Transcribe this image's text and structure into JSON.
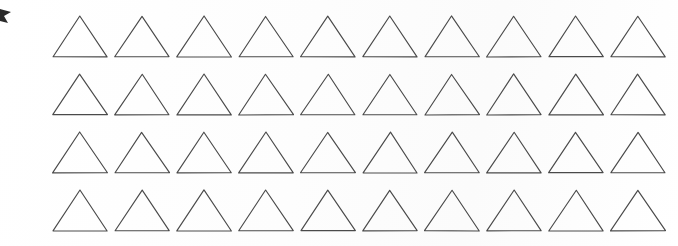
{
  "page": {
    "width": 678,
    "height": 246,
    "background_color": "#fefefe"
  },
  "corner_mark": {
    "name": "clipped-wedge-mark",
    "description": "Small dark wedge-shaped mark clipped at the left edge near the top",
    "color": "#2b2b2b",
    "x": 0,
    "y": 9,
    "width": 13,
    "height": 15
  },
  "grid": {
    "label": "Triangle grid",
    "columns": 10,
    "rows": 4,
    "total_shapes": 40,
    "origin_x": 52,
    "origin_y": 15,
    "column_pitch": 62,
    "row_pitch": 58,
    "shape": {
      "kind": "triangle",
      "name": "equilateral-triangle-outline",
      "fill": "none",
      "stroke_color": "#4a4a4a",
      "stroke_width": 1.15,
      "width": 56,
      "height": 43
    },
    "rows_data": [
      {
        "row_index": 1,
        "baseline_y": 58,
        "count": 10
      },
      {
        "row_index": 2,
        "baseline_y": 113,
        "count": 10
      },
      {
        "row_index": 3,
        "baseline_y": 175,
        "count": 10
      },
      {
        "row_index": 4,
        "baseline_y": 232,
        "count": 10
      }
    ]
  }
}
